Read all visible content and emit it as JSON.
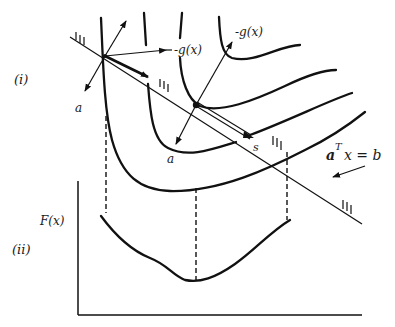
{
  "diagram": {
    "panel_i_label": "(i)",
    "panel_ii_label": "(ii)",
    "labels": {
      "neg_grad_1": "-g(x)",
      "neg_grad_2": "-g(x)",
      "normal_1": "a",
      "normal_2": "a",
      "search_dir": "s",
      "constraint_a": "a",
      "constraint_T": "T",
      "constraint_rest": "x = b",
      "y_axis": "F(x)"
    }
  }
}
